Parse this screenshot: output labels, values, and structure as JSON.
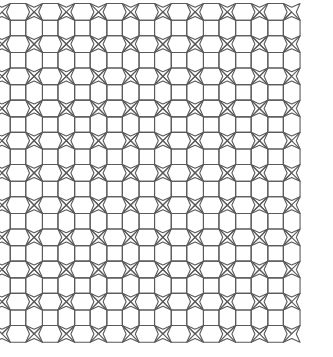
{
  "figure": {
    "type": "line-drawing",
    "background_color": "#ffffff",
    "stroke_color": "#5a5a5a",
    "stroke_width": 1.1,
    "fill": "none",
    "canvas": {
      "width": 333,
      "height": 357
    }
  },
  "pattern": {
    "name": "square-hexagon-star-tiling",
    "lattice": {
      "origin_x": 18,
      "origin_y": 28,
      "period_x": 32.2,
      "period_y": 32.2,
      "columns": 9,
      "rows": 10
    },
    "motifs": [
      {
        "name": "square",
        "count": 90,
        "size": 15.5,
        "description": "axis-aligned square centered on each lattice node"
      },
      {
        "name": "hexagon-horizontal",
        "count": 80,
        "description": "elongated hexagon bridging horizontally adjacent squares, apex above and below the square edges"
      },
      {
        "name": "hexagon-vertical",
        "count": 81,
        "description": "elongated hexagon bridging vertically adjacent squares, apex left and right of the square edges"
      },
      {
        "name": "four-pointed-star",
        "count": 72,
        "description": "concave four-pointed star filling each diagonal cell between four squares"
      }
    ],
    "symmetry": "p4m",
    "shape_apex_offset": 8.2,
    "star_point_reach": 16.1,
    "star_waist": 4.6
  }
}
